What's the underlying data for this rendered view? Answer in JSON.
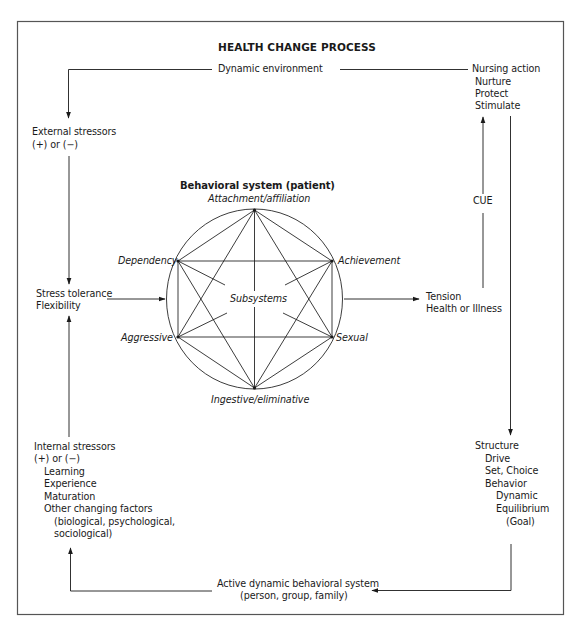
{
  "figure": {
    "title": "HEALTH CHANGE PROCESS",
    "top_cut_glyph": "y"
  },
  "labels": {
    "dynamic_environment": "Dynamic environment",
    "nursing_action": {
      "heading": "Nursing action",
      "items": [
        "Nurture",
        "Protect",
        "Stimulate"
      ]
    },
    "external_stressors": {
      "line1": "External stressors",
      "line2": "(+) or (−)"
    },
    "stress_tolerance": {
      "line1": "Stress tolerance",
      "line2": "Flexibility"
    },
    "internal_stressors": {
      "line1": "Internal stressors",
      "line2": "(+) or (−)",
      "items": [
        "Learning",
        "Experience",
        "Maturation",
        "Other changing factors"
      ],
      "sub_items": [
        "(biological, psychological,",
        "sociological)"
      ]
    },
    "cue": "CUE",
    "tension": {
      "line1": "Tension",
      "line2": "Health or Illness"
    },
    "structure": {
      "line1": "Structure",
      "line2": "Drive",
      "line3": "Set, Choice",
      "line4": "Behavior",
      "line5": "Dynamic",
      "line6": "Equilibrium",
      "line7": "(Goal)"
    },
    "active_system": {
      "line1": "Active dynamic behavioral system",
      "line2": "(person, group, family)"
    }
  },
  "behavioral_system": {
    "title": "Behavioral system (patient)",
    "center_label": "Subsystems",
    "subsystems": {
      "top": "Attachment/affiliation",
      "upper_left": "Dependency",
      "upper_right": "Achievement",
      "lower_left": "Aggressive",
      "lower_right": "Sexual",
      "bottom": "Ingestive/eliminative"
    }
  },
  "colors": {
    "line": "#1a1a1a",
    "border": "#444444",
    "background": "#ffffff"
  }
}
